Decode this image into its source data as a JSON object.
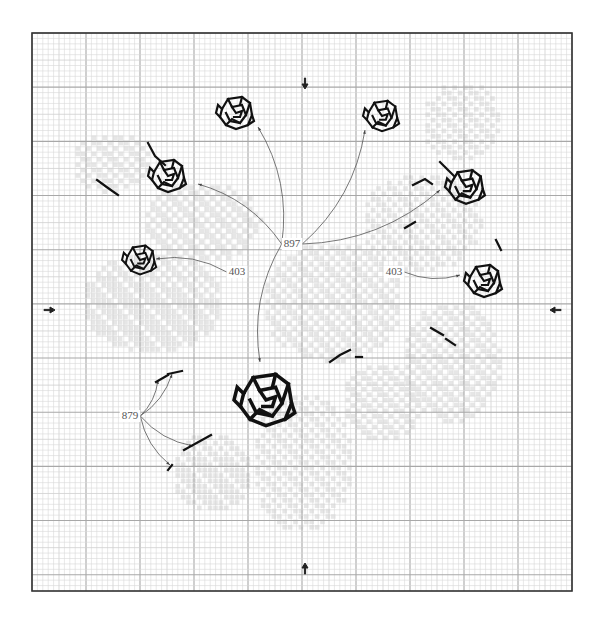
{
  "diagram": {
    "type": "cross-stitch-chart",
    "grid": {
      "left": 32,
      "top": 33,
      "right": 572,
      "bottom": 591,
      "cell_px": 5.4,
      "major_every": 10,
      "mid_every": 5,
      "colors": {
        "minor": "#d9d9d9",
        "major": "#a8a8a8",
        "frame": "#333333"
      }
    },
    "center_markers": [
      {
        "id": "top",
        "x": 305,
        "y": 86,
        "dir": "down"
      },
      {
        "id": "bottom",
        "x": 305,
        "y": 566,
        "dir": "up"
      },
      {
        "id": "left",
        "x": 52,
        "y": 310,
        "dir": "right"
      },
      {
        "id": "right",
        "x": 553,
        "y": 310,
        "dir": "left"
      }
    ],
    "callouts": [
      {
        "label": "897",
        "x": 292,
        "y": 244,
        "targets": [
          [
            258,
            127
          ],
          [
            365,
            130
          ],
          [
            198,
            184
          ],
          [
            440,
            190
          ],
          [
            260,
            362
          ]
        ]
      },
      {
        "label": "403",
        "x": 237,
        "y": 272,
        "targets": [
          [
            156,
            259
          ]
        ]
      },
      {
        "label": "403",
        "x": 394,
        "y": 272,
        "targets": [
          [
            460,
            275
          ]
        ]
      },
      {
        "label": "879",
        "x": 130,
        "y": 416,
        "targets": [
          [
            158,
            380
          ],
          [
            172,
            374
          ],
          [
            193,
            446
          ],
          [
            170,
            465
          ]
        ]
      }
    ],
    "roses": [
      {
        "id": "rose-top-left",
        "cx": 236,
        "cy": 113,
        "scale": 1.0
      },
      {
        "id": "rose-top-right",
        "cx": 382,
        "cy": 116,
        "scale": 0.95
      },
      {
        "id": "rose-upper-left",
        "cx": 168,
        "cy": 176,
        "scale": 1.0
      },
      {
        "id": "rose-upper-right",
        "cx": 466,
        "cy": 187,
        "scale": 1.05
      },
      {
        "id": "rose-left-bud",
        "cx": 140,
        "cy": 260,
        "scale": 0.9
      },
      {
        "id": "rose-right-bud",
        "cx": 484,
        "cy": 281,
        "scale": 1.0
      },
      {
        "id": "rose-center-large",
        "cx": 266,
        "cy": 400,
        "scale": 1.6
      }
    ],
    "stem_strokes": [
      [
        [
          97,
          180
        ],
        [
          108,
          188
        ],
        [
          118,
          195
        ]
      ],
      [
        [
          148,
          143
        ],
        [
          155,
          156
        ],
        [
          165,
          165
        ]
      ],
      [
        [
          405,
          228
        ],
        [
          415,
          222
        ]
      ],
      [
        [
          431,
          328
        ],
        [
          443,
          335
        ]
      ],
      [
        [
          446,
          339
        ],
        [
          455,
          345
        ]
      ],
      [
        [
          496,
          240
        ],
        [
          501,
          250
        ]
      ],
      [
        [
          330,
          362
        ],
        [
          340,
          355
        ],
        [
          350,
          350
        ]
      ],
      [
        [
          356,
          357
        ],
        [
          362,
          357
        ]
      ],
      [
        [
          440,
          162
        ],
        [
          454,
          176
        ]
      ],
      [
        [
          413,
          185
        ],
        [
          425,
          179
        ],
        [
          432,
          184
        ]
      ],
      [
        [
          184,
          450
        ],
        [
          211,
          435
        ]
      ],
      [
        [
          156,
          382
        ],
        [
          168,
          375
        ]
      ],
      [
        [
          168,
          374
        ],
        [
          182,
          371
        ]
      ],
      [
        [
          172,
          465
        ],
        [
          168,
          470
        ]
      ]
    ]
  }
}
